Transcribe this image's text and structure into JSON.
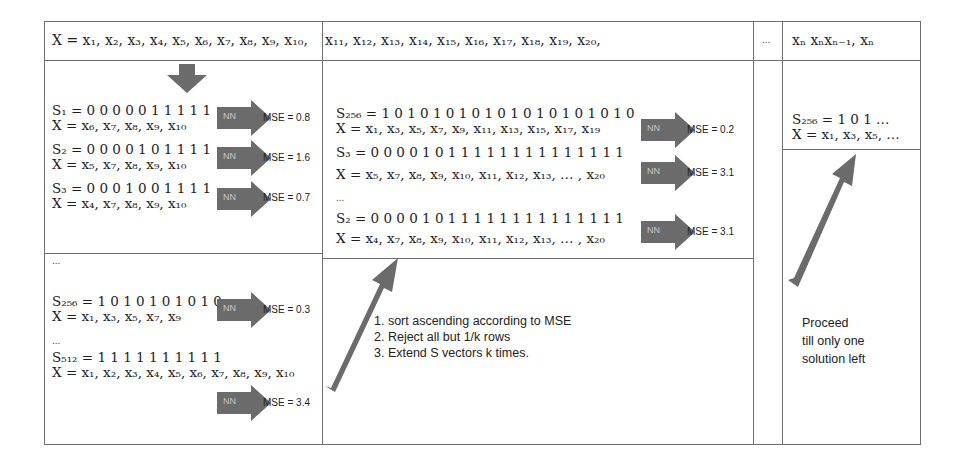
{
  "header": {
    "x_seq_part1": "X = x₁, x₂, x₃, x₄, x₅, x₆, x₇, x₈, x₉, x₁₀,",
    "x_seq_part2": "x₁₁, x₁₂, x₁₃, x₁₄, x₁₅, x₁₆,  x₁₇, x₁₈, x₁₉, x₂₀,",
    "ellipsis": "...",
    "x_seq_last": "xₙ xₙxₙ₋₁, xₙ"
  },
  "stage1": {
    "rows": [
      {
        "s": "S₁ = 0 0 0 0 0 1 1 1 1 1",
        "x": "X = x₆, x₇, x₈, x₉, x₁₀",
        "nn": "NN",
        "mse": "MSE = 0.8"
      },
      {
        "s": "S₂ = 0 0 0 0 1 0 1 1 1 1",
        "x": "X = x₅, x₇, x₈, x₉, x₁₀",
        "nn": "NN",
        "mse": "MSE = 1.6"
      },
      {
        "s": "S₃ = 0 0 0 1 0 0 1 1 1 1",
        "x": "X = x₄, x₇, x₈, x₉, x₁₀",
        "nn": "NN",
        "mse": "MSE = 0.7"
      }
    ],
    "ellipsis_a": "...",
    "row256": {
      "s": "S₂₅₆ = 1 0 1 0 1 0 1 0 1 0",
      "x": "X = x₁, x₃, x₅, x₇, x₉",
      "nn": "NN",
      "mse": "MSE = 0.3"
    },
    "ellipsis_b": "...",
    "row512": {
      "s": "S₅₁₂ = 1 1 1 1 1 1 1 1 1 1",
      "x": "X = x₁, x₂, x₃, x₄, x₅, x₆, x₇, x₈, x₉, x₁₀",
      "nn": "NN",
      "mse": "MSE = 3.4"
    }
  },
  "stage2": {
    "rows": [
      {
        "s": "S₂₅₆ = 1 0 1 0 1 0 1 0 1 0 1 0 1 0 1 0 1 0 1 0",
        "x": "X = x₁, x₃, x₅, x₇, x₉, x₁₁, x₁₃, x₁₅, x₁₇, x₁₉",
        "nn": "NN",
        "mse": "MSE = 0.2"
      },
      {
        "s": "S₃ = 0 0 0 0 1 0 1 1 1 1 1 1 1 1 1 1 1 1 1 1",
        "x": "X = x₅, x₇, x₈, x₉, x₁₀, x₁₁, x₁₂, x₁₃, … , x₂₀",
        "nn": "NN",
        "mse": "MSE = 3.1"
      },
      {
        "s": "S₂ = 0 0 0 0 1 0 1 1 1 1 1 1 1 1 1 1 1 1 1 1",
        "x": "X = x₄, x₇, x₈, x₉, x₁₀, x₁₁, x₁₂, x₁₃, … , x₂₀",
        "nn": "NN",
        "mse": "MSE = 3.1"
      }
    ],
    "ellipsis": "...",
    "steps": [
      "1.   sort ascending according to MSE",
      "2.   Reject all but 1/k rows",
      "3.   Extend S vectors k times."
    ]
  },
  "final": {
    "s": "S₂₅₆ = 1 0 1  …",
    "x": "X = x₁, x₃, x₅, …",
    "proceed_lines": [
      "Proceed",
      "till only one",
      "solution left"
    ]
  },
  "colors": {
    "arrow": "#6b6b6b",
    "border": "#6f6f6f",
    "nn_text": "#c9c9c9"
  }
}
